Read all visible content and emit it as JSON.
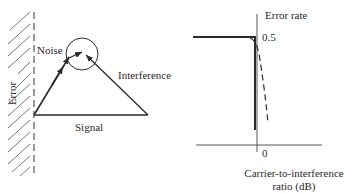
{
  "left_diagram": {
    "wall_label": "Error",
    "noise_label": "Noise",
    "interference_label": "Interference",
    "signal_label": "Signal"
  },
  "right_diagram": {
    "y_axis_label": "Error rate",
    "y_tick": "0.5",
    "x_tick": "0",
    "x_axis_label_line1": "Carrier-to-interference",
    "x_axis_label_line2": "ratio (dB)"
  },
  "colors": {
    "ink": "#2a2a2a",
    "background": "#ffffff"
  }
}
